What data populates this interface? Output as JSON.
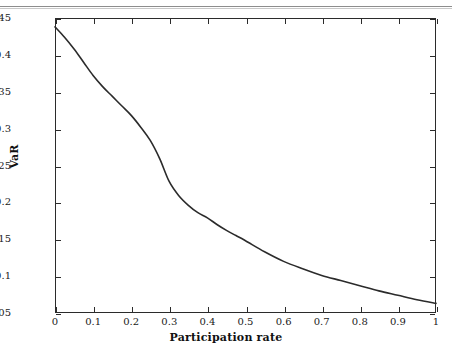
{
  "figure": {
    "top_rule": "horizontal-separator",
    "x_axis_title": "Participation rate",
    "y_axis_title": "VaR"
  },
  "chart_data": {
    "type": "line",
    "title": "",
    "subtitle": "",
    "xlabel": "Participation rate",
    "ylabel": "VaR",
    "xlim": [
      0,
      1
    ],
    "ylim": [
      0.05,
      0.45
    ],
    "xticks": [
      0,
      0.1,
      0.2,
      0.3,
      0.4,
      0.5,
      0.6,
      0.7,
      0.8,
      0.9,
      1
    ],
    "xtick_labels": [
      "0",
      "0.1",
      "0.2",
      "0.3",
      "0.4",
      "0.5",
      "0.6",
      "0.7",
      "0.8",
      "0.9",
      "1"
    ],
    "yticks": [
      0.05,
      0.1,
      0.15,
      0.2,
      0.25,
      0.3,
      0.35,
      0.4,
      0.45
    ],
    "ytick_labels": [
      "0.05",
      "0.1",
      "0.15",
      "0.2",
      "0.25",
      "0.3",
      "0.35",
      "0.4",
      "0.45"
    ],
    "grid": false,
    "legend": null,
    "line_color": "#2b2b2b",
    "line_width": 1.6,
    "x": [
      0,
      0.025,
      0.05,
      0.075,
      0.1,
      0.125,
      0.15,
      0.175,
      0.2,
      0.225,
      0.25,
      0.275,
      0.3,
      0.325,
      0.35,
      0.375,
      0.4,
      0.425,
      0.45,
      0.475,
      0.5,
      0.55,
      0.6,
      0.65,
      0.7,
      0.75,
      0.8,
      0.85,
      0.9,
      0.95,
      1
    ],
    "values": [
      0.438,
      0.424,
      0.408,
      0.39,
      0.372,
      0.357,
      0.344,
      0.331,
      0.318,
      0.302,
      0.284,
      0.259,
      0.228,
      0.209,
      0.196,
      0.186,
      0.179,
      0.17,
      0.162,
      0.155,
      0.148,
      0.133,
      0.12,
      0.11,
      0.101,
      0.094,
      0.087,
      0.08,
      0.074,
      0.068,
      0.063
    ]
  }
}
